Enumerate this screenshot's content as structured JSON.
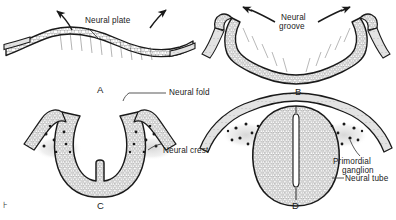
{
  "figure": {
    "type": "scientific-illustration",
    "background_color": "#ffffff",
    "ink_color": "#1a1a1a",
    "panels": [
      {
        "letter": "A",
        "name": "neural-plate-stage",
        "description": "Flat, thickened neural plate ectoderm with arrows indicating upward folding",
        "labels": [
          "Neural plate"
        ],
        "arrows": 2
      },
      {
        "letter": "B",
        "name": "neural-groove-stage",
        "description": "V-shaped neural groove with neural folds elevating toward midline",
        "labels": [
          "Neural groove"
        ],
        "arrows": 2
      },
      {
        "letter": "C",
        "name": "neural-fold-stage",
        "description": "Deep U-shaped groove, neural folds approaching, neural crest cells along fold margins",
        "labels": [
          "Neural fold",
          "Neural crest"
        ],
        "arrows": 0
      },
      {
        "letter": "D",
        "name": "neural-tube-stage",
        "description": "Closed neural tube beneath surface ectoderm with primordial ganglia lateral to tube",
        "labels": [
          "Primordial ganglion",
          "Neural tube"
        ],
        "arrows": 0
      }
    ],
    "annotations": {
      "neural_plate": "Neural plate",
      "neural_groove_line1": "Neural",
      "neural_groove_line2": "groove",
      "neural_fold": "Neural fold",
      "neural_crest": "Neural crest",
      "primordial_ganglion_line1": "Primordial",
      "primordial_ganglion_line2": "ganglion",
      "neural_tube": "Neural tube"
    },
    "panel_letters": {
      "a": "A",
      "b": "B",
      "c": "C",
      "d": "D"
    },
    "margin_mark": "⊦"
  }
}
